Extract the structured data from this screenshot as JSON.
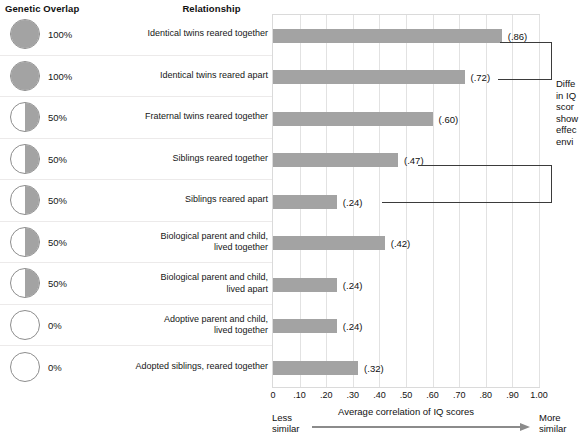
{
  "headers": {
    "genetic_overlap": "Genetic Overlap",
    "relationship": "Relationship"
  },
  "chart_data": {
    "type": "bar",
    "title": "",
    "xlabel": "Average correlation of IQ scores",
    "ylabel": "",
    "xlim": [
      0,
      1.0
    ],
    "grid": true,
    "orientation": "horizontal",
    "categories": [
      "Identical twins reared together",
      "Identical twins reared apart",
      "Fraternal twins reared together",
      "Siblings reared together",
      "Siblings reared apart",
      "Biological parent and child,\nlived together",
      "Biological parent and child,\nlived apart",
      "Adoptive parent and child,\nlived together",
      "Adopted siblings, reared together"
    ],
    "values": [
      0.86,
      0.72,
      0.6,
      0.47,
      0.24,
      0.42,
      0.24,
      0.24,
      0.32
    ],
    "value_labels": [
      "(.86)",
      "(.72)",
      "(.60)",
      "(.47)",
      "(.24)",
      "(.42)",
      "(.24)",
      "(.24)",
      "(.32)"
    ],
    "genetic_overlap": [
      "100%",
      "100%",
      "50%",
      "50%",
      "50%",
      "50%",
      "50%",
      "0%",
      "0%"
    ],
    "circle_fill": [
      "full",
      "full",
      "half",
      "half",
      "half",
      "half",
      "half",
      "empty",
      "empty"
    ],
    "tick_labels": [
      "0",
      ".10",
      ".20",
      ".30",
      ".40",
      ".50",
      ".60",
      ".70",
      ".80",
      ".90",
      "1.00"
    ],
    "tick_values": [
      0,
      0.1,
      0.2,
      0.3,
      0.4,
      0.5,
      0.6,
      0.7,
      0.8,
      0.9,
      1.0
    ],
    "bar_color": "#a3a3a3",
    "grid_color": "#e2e2e2"
  },
  "annotation": {
    "text": "Diffe\nin IQ\nscor\nshow\neffec\nenvi"
  },
  "axis_endpoints": {
    "less_similar": "Less\nsimilar",
    "more_similar": "More\nsimilar"
  }
}
